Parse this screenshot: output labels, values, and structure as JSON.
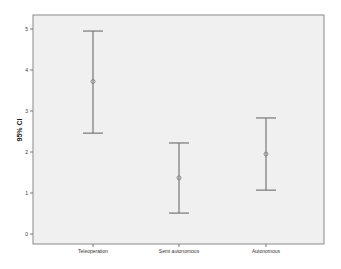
{
  "chart_data": {
    "type": "errorbar",
    "title": "",
    "xlabel": "",
    "ylabel": "95% CI",
    "ylim": [
      -0.25,
      5.3
    ],
    "yticks": [
      0,
      1,
      2,
      3,
      4,
      5
    ],
    "grid": false,
    "legend": null,
    "categories": [
      "Teleoperation",
      "Semi autonomous",
      "Autonomous"
    ],
    "series": [
      {
        "name": "95% CI",
        "mean": [
          3.72,
          1.37,
          1.95
        ],
        "lower": [
          2.46,
          0.51,
          1.07
        ],
        "upper": [
          4.95,
          2.22,
          2.83
        ]
      }
    ]
  },
  "colors": {
    "plot_background": "#f0f0f0",
    "axis": "#777777",
    "errorbar": "#777777",
    "marker": "#888888"
  }
}
